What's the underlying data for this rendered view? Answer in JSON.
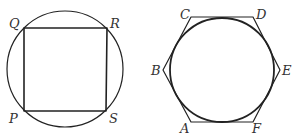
{
  "figures": [
    {
      "name": "square-in-circle",
      "circle": {
        "cx": 65,
        "cy": 69,
        "r": 58,
        "stroke": "#555555",
        "stroke_width": 1.2
      },
      "polygon": {
        "points": "24,28 107,28 106,111 24,111",
        "stroke": "#222222",
        "stroke_width": 1.6
      },
      "labels": [
        {
          "text": "Q",
          "x": 9,
          "y": 28
        },
        {
          "text": "R",
          "x": 110,
          "y": 28
        },
        {
          "text": "P",
          "x": 9,
          "y": 123
        },
        {
          "text": "S",
          "x": 109,
          "y": 123
        }
      ]
    },
    {
      "name": "circle-in-hexagon",
      "circle": {
        "cx": 222,
        "cy": 70,
        "r": 52,
        "stroke": "#222222",
        "stroke_width": 1.8
      },
      "polygon": {
        "points": "191,17 253,17 280,70 253,122 191,122 163,70",
        "stroke": "#333333",
        "stroke_width": 1.2
      },
      "labels": [
        {
          "text": "C",
          "x": 180,
          "y": 19
        },
        {
          "text": "D",
          "x": 256,
          "y": 19
        },
        {
          "text": "B",
          "x": 151,
          "y": 75
        },
        {
          "text": "E",
          "x": 282,
          "y": 75
        },
        {
          "text": "A",
          "x": 180,
          "y": 133
        },
        {
          "text": "F",
          "x": 252,
          "y": 133
        }
      ]
    }
  ]
}
